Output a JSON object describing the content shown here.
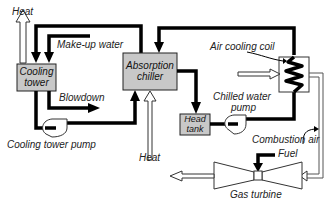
{
  "diagram": {
    "components": {
      "cooling_tower": "Cooling tower",
      "absorption_chiller": "Absorption chiller",
      "head_tank": "Head tank",
      "air_cooling_coil": "Air cooling coil",
      "gas_turbine": "Gas turbine",
      "cooling_tower_pump": "Cooling tower pump",
      "chilled_water_pump": "Chilled water pump"
    },
    "labels": {
      "heat_top": "Heat",
      "makeup_water": "Make-up water",
      "blowdown": "Blowdown",
      "cooling_tower_pump": "Cooling tower pump",
      "heat_bottom": "Heat",
      "air_cooling_coil": "Air cooling coil",
      "chilled_water_pump_line1": "Chilled water",
      "chilled_water_pump_line2": "pump",
      "combustion_air": "Combustion air",
      "fuel": "Fuel",
      "gas_turbine": "Gas turbine",
      "cooling_tower_line1": "Cooling",
      "cooling_tower_line2": "tower",
      "absorption_chiller_line1": "Absorption",
      "absorption_chiller_line2": "chiller",
      "head_tank_line1": "Head",
      "head_tank_line2": "tank"
    },
    "colors": {
      "box_fill": "#c8c8c8",
      "line": "#000000",
      "background": "#ffffff"
    }
  }
}
